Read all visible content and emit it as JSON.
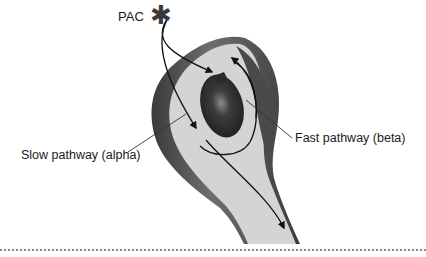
{
  "figure": {
    "type": "schematic of AV nodal reentry pathways",
    "pac": {
      "label": "PAC",
      "marker": "star-icon",
      "glyph": "✱"
    },
    "labels": {
      "slow_pathway": "Slow pathway (alpha)",
      "fast_pathway": "Fast pathway (beta)"
    },
    "colors": {
      "body_fill": "#d2d2d2",
      "outer_shadow": "#4a4a4a",
      "inner_core": "#2e2e2e",
      "arrow": "#111111",
      "leader_line": "#333333",
      "divider": "#8a8a8a"
    }
  }
}
